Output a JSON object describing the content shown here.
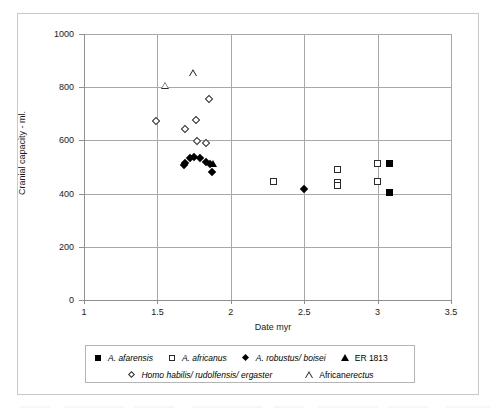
{
  "chart_data": {
    "type": "scatter",
    "title": "",
    "xlabel": "Date myr",
    "ylabel": "Cranial capacity - ml.",
    "xlim": [
      1,
      3.5
    ],
    "ylim": [
      0,
      1000
    ],
    "xticks": [
      "1",
      "1.5",
      "2",
      "2.5",
      "3",
      "3.5"
    ],
    "xtick_values": [
      1,
      1.5,
      2,
      2.5,
      3,
      3.5
    ],
    "yticks": [
      "0",
      "200",
      "400",
      "600",
      "800",
      "1000"
    ],
    "ytick_values": [
      0,
      200,
      400,
      600,
      800,
      1000
    ],
    "grid": true,
    "legend_position": "below-axes",
    "series": [
      {
        "name": "A. afarensis",
        "marker": "square-filled",
        "points": [
          {
            "x": 3.08,
            "y": 512
          },
          {
            "x": 3.08,
            "y": 406
          }
        ]
      },
      {
        "name": "A. africanus",
        "marker": "square-open",
        "points": [
          {
            "x": 2.29,
            "y": 445
          },
          {
            "x": 2.73,
            "y": 490
          },
          {
            "x": 2.73,
            "y": 442
          },
          {
            "x": 2.73,
            "y": 430
          },
          {
            "x": 3.0,
            "y": 512
          },
          {
            "x": 3.0,
            "y": 444
          }
        ]
      },
      {
        "name": "A. robustus/ boisei",
        "marker": "diamond-filled",
        "points": [
          {
            "x": 1.68,
            "y": 508
          },
          {
            "x": 1.69,
            "y": 516
          },
          {
            "x": 1.72,
            "y": 532
          },
          {
            "x": 1.75,
            "y": 536
          },
          {
            "x": 1.79,
            "y": 533
          },
          {
            "x": 1.83,
            "y": 517
          },
          {
            "x": 1.86,
            "y": 513
          },
          {
            "x": 1.87,
            "y": 481
          },
          {
            "x": 2.5,
            "y": 417
          }
        ]
      },
      {
        "name": "ER 1813",
        "marker": "triangle-filled",
        "points": [
          {
            "x": 1.88,
            "y": 512
          }
        ]
      },
      {
        "name": "Homo habilis/ rudolfensis/ ergaster",
        "marker": "diamond-open",
        "points": [
          {
            "x": 1.49,
            "y": 673
          },
          {
            "x": 1.69,
            "y": 641
          },
          {
            "x": 1.76,
            "y": 676
          },
          {
            "x": 1.77,
            "y": 597
          },
          {
            "x": 1.83,
            "y": 590
          },
          {
            "x": 1.85,
            "y": 757
          }
        ]
      },
      {
        "name": "African erectus",
        "marker": "triangle-open",
        "points": [
          {
            "x": 1.55,
            "y": 805
          },
          {
            "x": 1.74,
            "y": 852
          }
        ]
      }
    ]
  },
  "legend": {
    "rows": [
      [
        {
          "marker": "square-filled",
          "label_italic": "A. afarensis",
          "label_roman": ""
        },
        {
          "marker": "square-open",
          "label_italic": "A. africanus",
          "label_roman": ""
        },
        {
          "marker": "diamond-filled",
          "label_italic": "A. robustus/ boisei",
          "label_roman": ""
        },
        {
          "marker": "triangle-filled",
          "label_italic": "",
          "label_roman": "ER 1813"
        }
      ],
      [
        {
          "marker": "diamond-open",
          "label_italic": "Homo habilis/ rudolfensis/ ergaster",
          "label_roman": ""
        },
        {
          "marker": "triangle-open",
          "label_italic": "erectus",
          "label_roman": "African "
        }
      ]
    ]
  },
  "colors": {
    "marker_fill": "#000000",
    "marker_stroke": "#2b2b2b",
    "grid": "#a8a8a8",
    "axis": "#8f8f8f",
    "text": "#1a1a1a",
    "background": "#ffffff",
    "frame": "#c9c9c9"
  }
}
